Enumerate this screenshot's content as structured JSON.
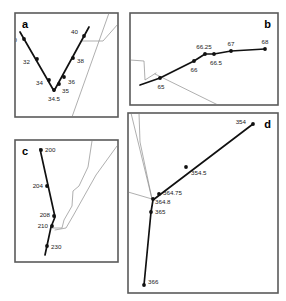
{
  "figure": {
    "title": "",
    "background_color": "#ffffff",
    "frame_color": "#5a5a5a",
    "thick_line_color": "#111111",
    "thin_line_color": "#8d8d8d",
    "panel_letters": {
      "a": "a",
      "b": "b",
      "c": "c",
      "d": "d"
    }
  },
  "chart_data": [
    {
      "id": "a",
      "type": "line",
      "title": "a",
      "xlabel": "",
      "ylabel": "",
      "grid": false,
      "legend": false,
      "axis_visible": false,
      "panel_box": {
        "x": 15,
        "y": 13,
        "w": 103,
        "h": 104
      },
      "series": [
        {
          "name": "profile-a",
          "style": "thick",
          "labels": [
            "30",
            "32",
            "34",
            "34.5",
            "35",
            "36",
            "38",
            "40"
          ],
          "points": [
            {
              "label": "30",
              "x": 24,
              "y": 39,
              "lx": 17,
              "ly": 42,
              "anchor": "end"
            },
            {
              "label": "32",
              "x": 37,
              "y": 59,
              "lx": 30,
              "ly": 64,
              "anchor": "end"
            },
            {
              "label": "34",
              "x": 49,
              "y": 80,
              "lx": 43,
              "ly": 85,
              "anchor": "end"
            },
            {
              "label": "34.5",
              "x": 54,
              "y": 90,
              "lx": 54,
              "ly": 101,
              "anchor": "middle"
            },
            {
              "label": "35",
              "x": 59,
              "y": 84,
              "lx": 62,
              "ly": 93,
              "anchor": "start"
            },
            {
              "label": "36",
              "x": 64,
              "y": 77,
              "lx": 68,
              "ly": 84,
              "anchor": "start"
            },
            {
              "label": "38",
              "x": 73,
              "y": 58,
              "lx": 77,
              "ly": 63,
              "anchor": "start"
            },
            {
              "label": "40",
              "x": 84,
              "y": 36,
              "lx": 78,
              "ly": 34,
              "anchor": "end"
            }
          ],
          "path": "M 20,32 L 54,91 L 89,27"
        },
        {
          "name": "thin-a-1",
          "style": "thin",
          "path": "M 72,117 L 109,13"
        },
        {
          "name": "thin-a-2",
          "style": "thin",
          "path": "M 118,24 L 103,41 L 82,41"
        }
      ]
    },
    {
      "id": "b",
      "type": "line",
      "title": "b",
      "xlabel": "",
      "ylabel": "",
      "grid": false,
      "legend": false,
      "axis_visible": false,
      "panel_box": {
        "x": 130,
        "y": 13,
        "w": 148,
        "h": 92
      },
      "series": [
        {
          "name": "profile-b",
          "style": "thick",
          "labels": [
            "65",
            "66",
            "66.25",
            "66.5",
            "67",
            "68"
          ],
          "points": [
            {
              "label": "65",
              "x": 160,
              "y": 78,
              "lx": 161,
              "ly": 89,
              "anchor": "middle"
            },
            {
              "label": "66",
              "x": 194,
              "y": 61,
              "lx": 194,
              "ly": 72,
              "anchor": "middle"
            },
            {
              "label": "66.25",
              "x": 205,
              "y": 54,
              "lx": 204,
              "ly": 49,
              "anchor": "middle"
            },
            {
              "label": "66.5",
              "x": 214,
              "y": 54,
              "lx": 216,
              "ly": 65,
              "anchor": "middle"
            },
            {
              "label": "67",
              "x": 231,
              "y": 51,
              "lx": 231,
              "ly": 46,
              "anchor": "middle"
            },
            {
              "label": "68",
              "x": 265,
              "y": 49,
              "lx": 265,
              "ly": 44,
              "anchor": "middle"
            }
          ],
          "path": "M 140,85 L 160,78 L 194,61 L 205,54 L 214,54 L 231,51 L 265,49"
        },
        {
          "name": "thin-b-1",
          "style": "thin",
          "path": "M 130,60 L 144,61 L 145,80 L 156,73"
        },
        {
          "name": "thin-b-2",
          "style": "thin",
          "path": "M 155,74 L 218,105"
        }
      ]
    },
    {
      "id": "c",
      "type": "line",
      "title": "c",
      "xlabel": "",
      "ylabel": "",
      "grid": false,
      "legend": false,
      "axis_visible": false,
      "panel_box": {
        "x": 15,
        "y": 140,
        "w": 103,
        "h": 122
      },
      "series": [
        {
          "name": "profile-c",
          "style": "thick",
          "labels": [
            "200",
            "204",
            "208",
            "210",
            "230"
          ],
          "points": [
            {
              "label": "200",
              "x": 41,
              "y": 150,
              "lx": 45,
              "ly": 152,
              "anchor": "start"
            },
            {
              "label": "204",
              "x": 47,
              "y": 186,
              "lx": 43,
              "ly": 188,
              "anchor": "end"
            },
            {
              "label": "208",
              "x": 54,
              "y": 216,
              "lx": 50,
              "ly": 217,
              "anchor": "end"
            },
            {
              "label": "210",
              "x": 52,
              "y": 226,
              "lx": 48,
              "ly": 228,
              "anchor": "end"
            },
            {
              "label": "230",
              "x": 47,
              "y": 246,
              "lx": 51,
              "ly": 249,
              "anchor": "start"
            }
          ],
          "path": "M 40,149 L 55,217 L 51,227 L 45,255"
        },
        {
          "name": "thin-c-1",
          "style": "thin",
          "path": "M 52,228 L 62,228 L 64,220 L 72,206 L 73,191 L 79,186 L 88,167 L 92,141"
        },
        {
          "name": "thin-c-2",
          "style": "thin",
          "path": "M 55,230 L 66,228 L 73,216 L 87,191 L 96,175 L 117,146"
        }
      ]
    },
    {
      "id": "d",
      "type": "line",
      "title": "d",
      "xlabel": "",
      "ylabel": "",
      "grid": false,
      "legend": false,
      "axis_visible": false,
      "panel_box": {
        "x": 128,
        "y": 113,
        "w": 150,
        "h": 180
      },
      "series": [
        {
          "name": "profile-d",
          "style": "thick",
          "labels": [
            "354",
            "354.5",
            "364.75",
            "364.8",
            "365",
            "366"
          ],
          "points": [
            {
              "label": "354",
              "x": 253,
              "y": 124,
              "lx": 246,
              "ly": 124,
              "anchor": "end"
            },
            {
              "label": "354.5",
              "x": 186,
              "y": 167,
              "lx": 191,
              "ly": 175,
              "anchor": "start"
            },
            {
              "label": "364.75",
              "x": 159,
              "y": 194,
              "lx": 163,
              "ly": 195,
              "anchor": "start"
            },
            {
              "label": "364.8",
              "x": 153,
              "y": 199,
              "lx": 155,
              "ly": 204,
              "anchor": "start"
            },
            {
              "label": "365",
              "x": 151,
              "y": 212,
              "lx": 155,
              "ly": 214,
              "anchor": "start"
            },
            {
              "label": "366",
              "x": 144,
              "y": 285,
              "lx": 148,
              "ly": 284,
              "anchor": "start"
            }
          ],
          "path": "M 253,124 L 153,200 L 151,212 L 144,285"
        },
        {
          "name": "thin-d-1",
          "style": "thin",
          "path": "M 131,113 L 152,199"
        },
        {
          "name": "thin-d-2",
          "style": "thin",
          "path": "M 139,113 L 140,142 L 152,199"
        },
        {
          "name": "thin-d-3",
          "style": "thin",
          "path": "M 128,192 L 152,199"
        }
      ]
    }
  ]
}
